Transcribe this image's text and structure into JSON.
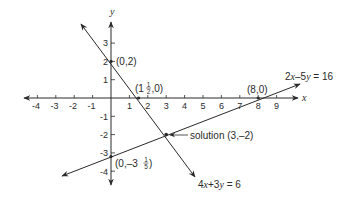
{
  "axes": {
    "x_label": "x",
    "y_label": "y",
    "x_ticks": [
      "-4",
      "-3",
      "-2",
      "-1",
      "1",
      "2",
      "3",
      "4",
      "5",
      "6",
      "7",
      "8",
      "9"
    ],
    "y_ticks": [
      "3",
      "2",
      "1",
      "-1",
      "-2",
      "-3",
      "-4"
    ]
  },
  "lines": [
    {
      "id": "line1",
      "equation_parts": {
        "a": "4",
        "v1": "x",
        "op": "+3",
        "v2": "y",
        "rhs": " = 6"
      },
      "intercepts": [
        "(0,2)",
        "(1½,0)"
      ]
    },
    {
      "id": "line2",
      "equation_parts": {
        "a": "2",
        "v1": "x",
        "op": "–5",
        "v2": "y",
        "rhs": " = 16"
      },
      "intercepts": [
        "(8,0)",
        "(0,–3⅕)"
      ]
    }
  ],
  "labels": {
    "p_0_2": "(0,2)",
    "p_1half_0": {
      "open": "(1",
      "num": "1",
      "den": "2",
      "close": ",0)"
    },
    "p_8_0": "(8,0)",
    "p_0_m3fifth": {
      "open": "(0,–3",
      "num": "1",
      "den": "5",
      "close": ")"
    },
    "solution": "solution (3,–2)"
  },
  "colors": {
    "ink": "#2a2a2a",
    "background": "#ffffff"
  }
}
